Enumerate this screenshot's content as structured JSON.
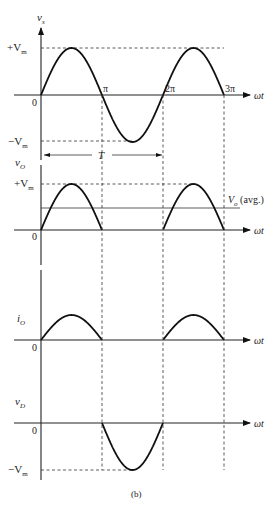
{
  "figure": {
    "caption": "(b)",
    "x_axis_label": "ωt",
    "x_ticks": [
      "0",
      "π",
      "2π",
      "3π"
    ],
    "period_label": "T",
    "colors": {
      "ink": "#111111",
      "background": "#ffffff"
    }
  },
  "panels": [
    {
      "id": "vs",
      "ylabel_main": "v",
      "ylabel_sub": "s",
      "upper_level": "+V",
      "upper_level_sub": "m",
      "lower_level": "−V",
      "lower_level_sub": "m",
      "zero_label": "0",
      "waveform": "full sine, amplitude Vm, over 0 to 3π"
    },
    {
      "id": "vo",
      "ylabel_main": "v",
      "ylabel_sub": "O",
      "upper_level": "+V",
      "upper_level_sub": "m",
      "zero_label": "0",
      "avg_label_main": "V",
      "avg_label_sub": "o",
      "avg_label_suffix": " (avg.)",
      "waveform": "positive half-cycles only (0–π, 2π–3π)"
    },
    {
      "id": "io",
      "ylabel_main": "i",
      "ylabel_sub": "O",
      "zero_label": "0",
      "waveform": "positive half-cycles only (0–π, 2π–3π)"
    },
    {
      "id": "vd",
      "ylabel_main": "v",
      "ylabel_sub": "D",
      "lower_level": "−V",
      "lower_level_sub": "m",
      "zero_label": "0",
      "waveform": "negative half-cycle only (π–2π)"
    }
  ]
}
